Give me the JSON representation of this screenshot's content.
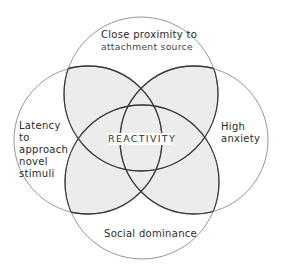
{
  "diagram": {
    "type": "four-circle-venn",
    "center_label": "REACTIVITY",
    "circles": [
      {
        "id": "top",
        "cx": 141,
        "cy": 94,
        "r": 77,
        "label_lines": [
          "Close proximity to",
          "attachment source"
        ]
      },
      {
        "id": "left",
        "cx": 88,
        "cy": 140,
        "r": 74,
        "label_lines": [
          "Latency",
          "to",
          "approach",
          "novel",
          "stimuli"
        ]
      },
      {
        "id": "right",
        "cx": 194,
        "cy": 140,
        "r": 74,
        "label_lines": [
          "High",
          "anxiety"
        ]
      },
      {
        "id": "bottom",
        "cx": 142,
        "cy": 182,
        "r": 77,
        "label_lines": [
          "Social dominance"
        ]
      }
    ],
    "colors": {
      "outline": "#6e6e6e",
      "inner_arc": "#3a3a3a",
      "overlap_fill": "#ececec",
      "background": "#ffffff"
    }
  },
  "labels": {
    "top": {
      "line1": "Close proximity to",
      "line2": "attachment source"
    },
    "left": {
      "line1": "Latency",
      "line2": "to",
      "line3": "approach",
      "line4": "novel",
      "line5": "stimuli"
    },
    "right": {
      "line1": "High",
      "line2": "anxiety"
    },
    "bottom": {
      "line1": "Social dominance"
    },
    "center": {
      "text": "REACTIVITY"
    }
  }
}
